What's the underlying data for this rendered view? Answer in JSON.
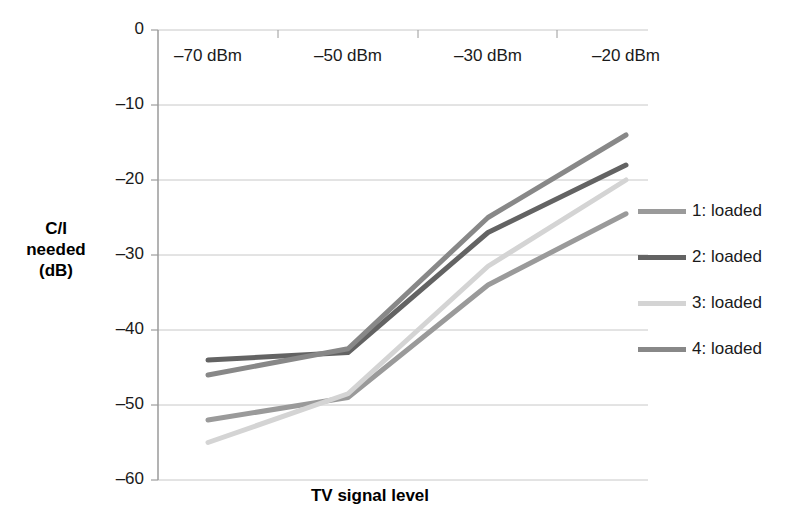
{
  "chart_data": {
    "type": "line",
    "title": "",
    "xlabel": "TV signal level",
    "ylabel": "C/I needed (dB)",
    "ylabel_lines": [
      "C/I",
      "needed",
      "(dB)"
    ],
    "categories": [
      "–70 dBm",
      "–50 dBm",
      "–30 dBm",
      "–20 dBm"
    ],
    "yticks": [
      "0",
      "–10",
      "–20",
      "–30",
      "–40",
      "–50",
      "–60"
    ],
    "ytick_values": [
      0,
      -10,
      -20,
      -30,
      -40,
      -50,
      -60
    ],
    "ylim": [
      -60,
      0
    ],
    "grid": true,
    "legend_position": "right",
    "series": [
      {
        "name": "1: loaded",
        "color": "#9a9a9a",
        "values": [
          -52,
          -49,
          -34,
          -24.5
        ]
      },
      {
        "name": "2: loaded",
        "color": "#636363",
        "values": [
          -44,
          -43,
          -27,
          -18
        ]
      },
      {
        "name": "3: loaded",
        "color": "#d4d4d4",
        "values": [
          -55,
          -48.5,
          -31.5,
          -20
        ]
      },
      {
        "name": "4: loaded",
        "color": "#888888",
        "values": [
          -46,
          -42.5,
          -25,
          -14
        ]
      }
    ]
  },
  "legend": {
    "items": [
      {
        "label": "1: loaded"
      },
      {
        "label": "2: loaded"
      },
      {
        "label": "3: loaded"
      },
      {
        "label": "4: loaded"
      }
    ]
  },
  "axes": {
    "y_title": "C/I\nneeded\n(dB)",
    "x_title": "TV signal level"
  }
}
